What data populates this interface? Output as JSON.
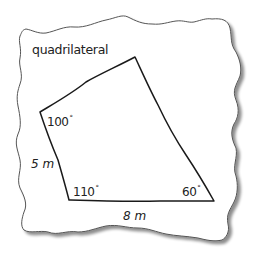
{
  "diagram": {
    "title": "quadrilateral",
    "paper": {
      "fill": "#ffffff",
      "stroke": "#555555",
      "shadow": "#b8b8b8"
    },
    "shape": {
      "type": "quadrilateral",
      "stroke": "#1a1a1a",
      "vertices": [
        {
          "name": "top",
          "x": 135,
          "y": 57
        },
        {
          "name": "left",
          "x": 40,
          "y": 112
        },
        {
          "name": "bottom-left",
          "x": 69,
          "y": 200
        },
        {
          "name": "bottom-right",
          "x": 214,
          "y": 201
        }
      ]
    },
    "angles": {
      "left": {
        "value": "100",
        "unit": "°"
      },
      "bottom_left": {
        "value": "110",
        "unit": "°"
      },
      "bottom_right": {
        "value": "60",
        "unit": "°"
      }
    },
    "sides": {
      "left": "5 m",
      "bottom": "8 m"
    }
  }
}
